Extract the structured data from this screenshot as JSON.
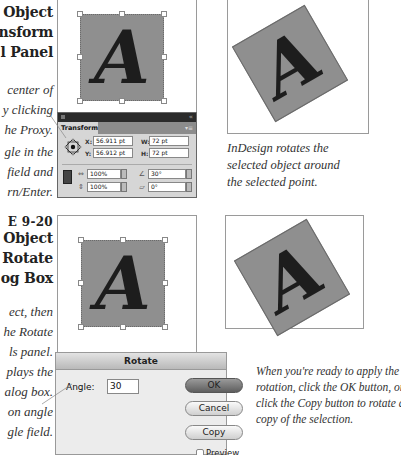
{
  "figure_9_19": {
    "title_lines": [
      "Object",
      "nsform",
      "l Panel"
    ],
    "callout_proxy_lines": [
      "center of",
      "y clicking",
      "he Proxy."
    ],
    "callout_angle_lines": [
      "gle in the",
      "field and",
      "rn/Enter."
    ]
  },
  "figure_9_20": {
    "label": "E 9-20",
    "title_lines": [
      "Object",
      "Rotate",
      "og Box"
    ],
    "callout_tools_lines": [
      "ect, then",
      "he Rotate",
      "ls panel.",
      "plays the",
      "alog box."
    ],
    "callout_angle_lines": [
      "on angle",
      "gle field."
    ]
  },
  "transform_panel": {
    "tab_label": "Transform",
    "x_label": "X:",
    "x_value": "56.911 pt",
    "y_label": "Y:",
    "y_value": "56.912 pt",
    "w_label": "W:",
    "w_value": "72 pt",
    "h_label": "H:",
    "h_value": "72 pt",
    "scale_x_value": "100%",
    "scale_y_value": "100%",
    "rotate_value": "30°",
    "shear_value": "0°",
    "collapse_glyph": "«",
    "menu_glyph": "▾≡"
  },
  "captions": {
    "rotates_caption_lines": [
      "InDesign rotates the",
      "selected object around",
      "the selected point."
    ],
    "apply_caption_lines": [
      "When you're ready to apply the",
      "rotation, click the OK button, or",
      "click the Copy button to rotate a",
      "copy of the selection."
    ]
  },
  "sample_letter": "A",
  "rotate_dialog": {
    "title": "Rotate",
    "angle_label": "Angle:",
    "angle_value": "30",
    "ok_label": "OK",
    "cancel_label": "Cancel",
    "copy_label": "Copy",
    "preview_label": "Preview"
  },
  "colors": {
    "object_fill": "#8f8f8f",
    "panel_title": "#2b2b2b",
    "ok_button": "#6e6e6e"
  }
}
